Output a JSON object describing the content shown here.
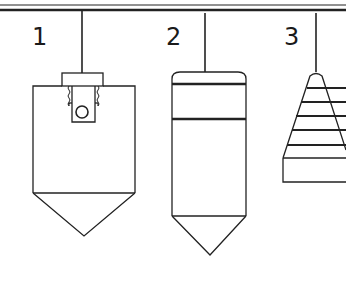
{
  "diagram": {
    "colors": {
      "stroke": "#222222",
      "background": "#ffffff"
    },
    "labels": [
      {
        "id": "1",
        "text": "1"
      },
      {
        "id": "2",
        "text": "2"
      },
      {
        "id": "3",
        "text": "3"
      }
    ],
    "items": [
      {
        "number": "1",
        "shape": "flat-top plumb bob with threaded cap and ball"
      },
      {
        "number": "2",
        "shape": "cylindrical plumb bob with banded rounded cap"
      },
      {
        "number": "3",
        "shape": "stepped conical plumb bob"
      }
    ]
  }
}
